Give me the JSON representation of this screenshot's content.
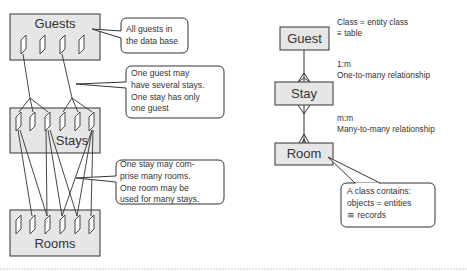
{
  "left_diagram": {
    "sets": [
      {
        "name": "Guests",
        "record_count": 4
      },
      {
        "name": "Stays",
        "record_count": 6
      },
      {
        "name": "Rooms",
        "record_count": 6
      }
    ],
    "callouts": [
      {
        "lines": [
          "All guests in",
          "the data base"
        ]
      },
      {
        "lines": [
          "One guest may",
          "have several stays.",
          "One stay has only",
          "one guest"
        ]
      },
      {
        "lines": [
          "One stay may com-",
          "prise many rooms.",
          "One room may be",
          "used for many stays."
        ]
      }
    ]
  },
  "right_diagram": {
    "entities": [
      {
        "name": "Guest"
      },
      {
        "name": "Stay"
      },
      {
        "name": "Room"
      }
    ],
    "annotations": [
      {
        "lines": [
          "Class = entity class",
          "≡ table"
        ]
      },
      {
        "lines": [
          "1:m",
          "One-to-many relationship"
        ]
      },
      {
        "lines": [
          "m:m",
          "Many-to-many relationship"
        ]
      }
    ],
    "callout": {
      "lines": [
        "A class contains:",
        "objects = entities",
        "≅ records"
      ]
    }
  },
  "colors": {
    "box_fill": "#e6e6e6",
    "stroke": "#333333",
    "bubble_fill": "#ffffff"
  }
}
